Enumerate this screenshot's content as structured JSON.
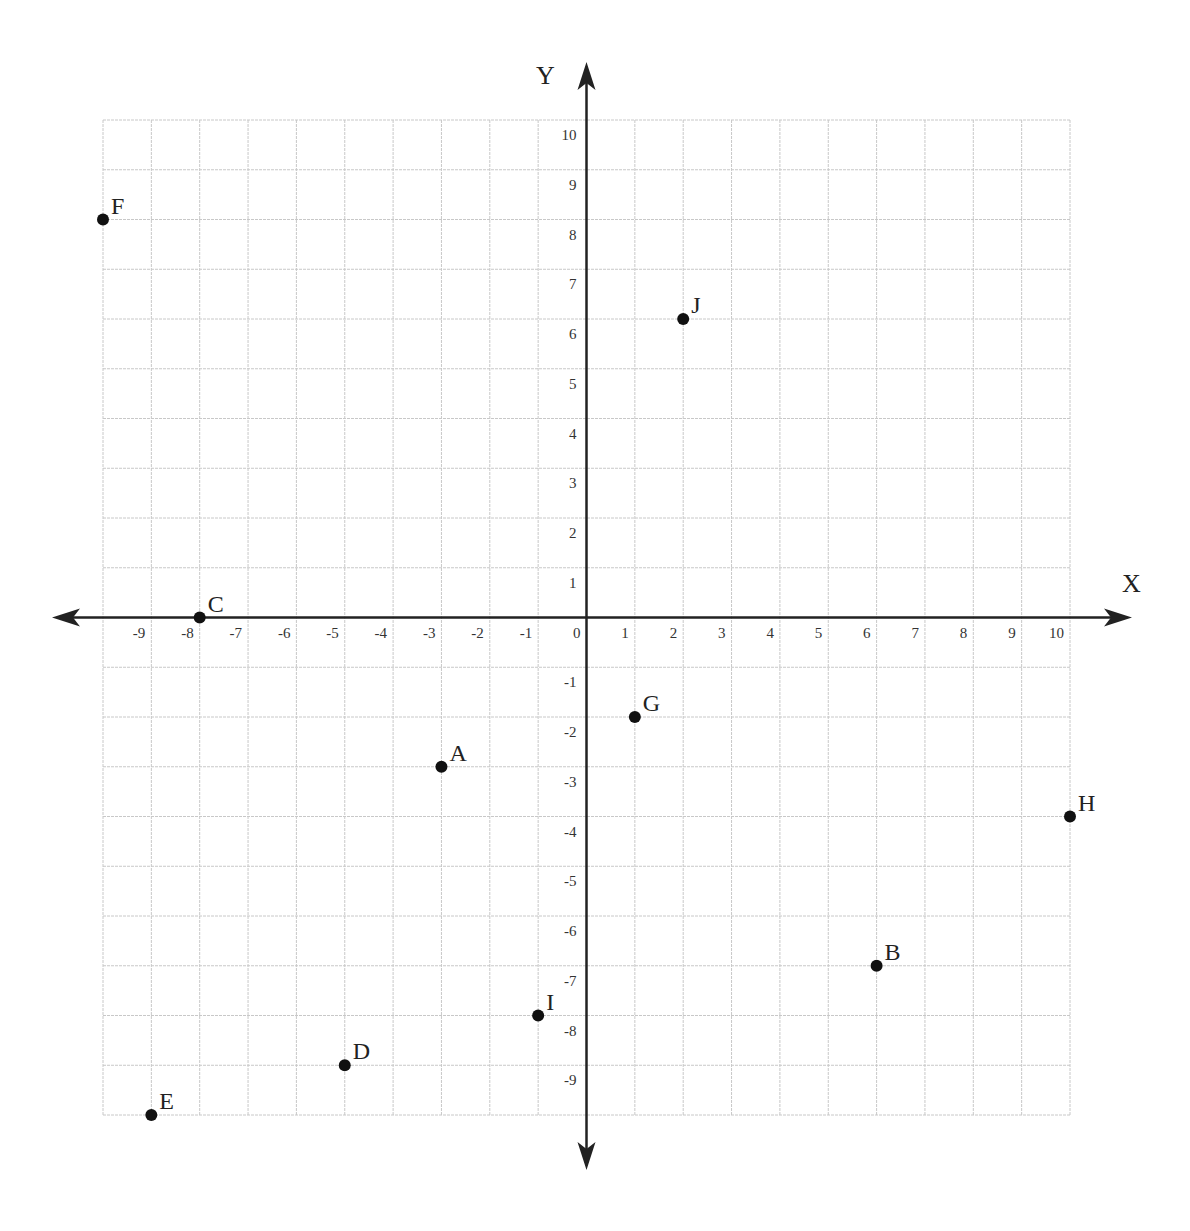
{
  "chart_data": {
    "type": "scatter",
    "title": "",
    "xlabel": "X",
    "ylabel": "Y",
    "xlim": [
      -10,
      10
    ],
    "ylim": [
      -10,
      10
    ],
    "grid": true,
    "legend": null,
    "x_ticks": [
      -9,
      -8,
      -7,
      -6,
      -5,
      -4,
      -3,
      -2,
      -1,
      0,
      1,
      2,
      3,
      4,
      5,
      6,
      7,
      8,
      9,
      10
    ],
    "y_ticks": [
      10,
      9,
      8,
      7,
      6,
      5,
      4,
      3,
      2,
      1,
      -1,
      -2,
      -3,
      -4,
      -5,
      -6,
      -7,
      -8,
      -9
    ],
    "points": [
      {
        "label": "A",
        "x": -3,
        "y": -3
      },
      {
        "label": "B",
        "x": 6,
        "y": -7
      },
      {
        "label": "C",
        "x": -8,
        "y": 0
      },
      {
        "label": "D",
        "x": -5,
        "y": -9
      },
      {
        "label": "E",
        "x": -9,
        "y": -10
      },
      {
        "label": "F",
        "x": -10,
        "y": 8
      },
      {
        "label": "G",
        "x": 1,
        "y": -2
      },
      {
        "label": "H",
        "x": 10,
        "y": -4
      },
      {
        "label": "I",
        "x": -1,
        "y": -8
      },
      {
        "label": "J",
        "x": 2,
        "y": 6
      }
    ]
  },
  "colors": {
    "grid": "#c8c8c8",
    "axis": "#222222",
    "point": "#111111"
  }
}
